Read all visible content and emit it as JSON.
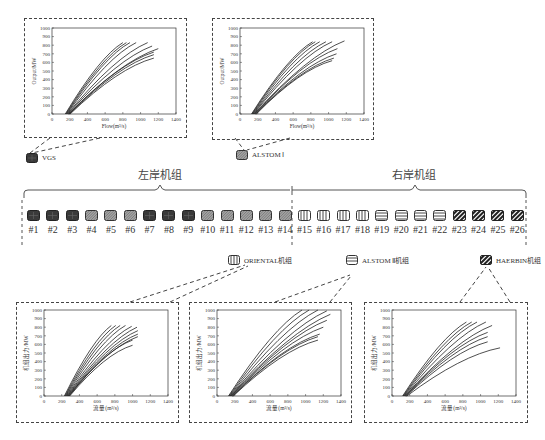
{
  "banks": {
    "left_label": "左岸机组",
    "right_label": "右岸机组"
  },
  "legend": [
    {
      "id": "vgs",
      "label": "VGS",
      "pattern": "dark-crosshatch"
    },
    {
      "id": "alstom1",
      "label": "ALSTOM Ⅰ",
      "pattern": "fine-diagonal"
    },
    {
      "id": "oriental",
      "label": "ORIENTAL机组",
      "pattern": "vertical-stripes"
    },
    {
      "id": "alstom2",
      "label": "ALSTOM Ⅱ机组",
      "pattern": "horizontal-stripes"
    },
    {
      "id": "haerbin",
      "label": "HAERBIN机组",
      "pattern": "bold-diagonal"
    }
  ],
  "units": [
    {
      "label": "#1",
      "type": "vgs"
    },
    {
      "label": "#2",
      "type": "vgs"
    },
    {
      "label": "#3",
      "type": "vgs"
    },
    {
      "label": "#4",
      "type": "alstom1"
    },
    {
      "label": "#5",
      "type": "alstom1"
    },
    {
      "label": "#6",
      "type": "alstom1"
    },
    {
      "label": "#7",
      "type": "vgs"
    },
    {
      "label": "#8",
      "type": "vgs"
    },
    {
      "label": "#9",
      "type": "vgs"
    },
    {
      "label": "#10",
      "type": "alstom1"
    },
    {
      "label": "#11",
      "type": "alstom1"
    },
    {
      "label": "#12",
      "type": "alstom1"
    },
    {
      "label": "#13",
      "type": "alstom1"
    },
    {
      "label": "#14",
      "type": "alstom1"
    },
    {
      "label": "#15",
      "type": "oriental"
    },
    {
      "label": "#16",
      "type": "oriental"
    },
    {
      "label": "#17",
      "type": "oriental"
    },
    {
      "label": "#18",
      "type": "oriental"
    },
    {
      "label": "#19",
      "type": "alstom2"
    },
    {
      "label": "#20",
      "type": "alstom2"
    },
    {
      "label": "#21",
      "type": "alstom2"
    },
    {
      "label": "#22",
      "type": "alstom2"
    },
    {
      "label": "#23",
      "type": "haerbin"
    },
    {
      "label": "#24",
      "type": "haerbin"
    },
    {
      "label": "#25",
      "type": "haerbin"
    },
    {
      "label": "#26",
      "type": "haerbin"
    }
  ],
  "charts": {
    "vgs": {
      "xlabel": "Flow(m³/s)",
      "ylabel": "Output/MW",
      "xticks": [
        "0",
        "200",
        "400",
        "600",
        "800",
        "1000",
        "1200",
        "1400"
      ],
      "yticks": [
        "0",
        "100",
        "200",
        "300",
        "400",
        "500",
        "600",
        "700",
        "800",
        "900",
        "1000"
      ]
    },
    "alstom1": {
      "xlabel": "Flow(m³/s)",
      "ylabel": "Output/MW",
      "xticks": [
        "0",
        "200",
        "400",
        "600",
        "800",
        "1000",
        "1200",
        "1400"
      ],
      "yticks": [
        "0",
        "100",
        "200",
        "300",
        "400",
        "500",
        "600",
        "700",
        "800",
        "900",
        "1000"
      ]
    },
    "oriental": {
      "xlabel": "流量(m³/s)",
      "ylabel": "机组出力/MW",
      "xticks": [
        "0",
        "200",
        "400",
        "600",
        "800",
        "1000",
        "1200",
        "1400"
      ],
      "yticks": [
        "0",
        "100",
        "200",
        "300",
        "400",
        "500",
        "600",
        "700",
        "800",
        "900",
        "1000"
      ]
    },
    "alstom2": {
      "xlabel": "流量(m³/s)",
      "ylabel": "机组出力/MW",
      "xticks": [
        "0",
        "200",
        "400",
        "600",
        "800",
        "1000",
        "1200",
        "1400"
      ],
      "yticks": [
        "0",
        "100",
        "200",
        "300",
        "400",
        "500",
        "600",
        "700",
        "800",
        "900",
        "1000"
      ]
    },
    "haerbin": {
      "xlabel": "流量(m³/s)",
      "ylabel": "机组出力/MW",
      "xticks": [
        "0",
        "200",
        "400",
        "600",
        "800",
        "1000",
        "1200",
        "1400"
      ],
      "yticks": [
        "0",
        "100",
        "200",
        "300",
        "400",
        "500",
        "600",
        "700",
        "800",
        "900",
        "1000"
      ]
    }
  },
  "curves": {
    "vgs": {
      "start": 150,
      "ends": [
        [
          800,
          830
        ],
        [
          840,
          830
        ],
        [
          880,
          830
        ],
        [
          950,
          830
        ],
        [
          1080,
          830
        ],
        [
          1130,
          790
        ],
        [
          1200,
          760
        ],
        [
          1150,
          720
        ],
        [
          1150,
          690
        ],
        [
          1150,
          650
        ]
      ]
    },
    "alstom1": {
      "start": 130,
      "ends": [
        [
          820,
          840
        ],
        [
          850,
          840
        ],
        [
          900,
          840
        ],
        [
          970,
          840
        ],
        [
          1040,
          840
        ],
        [
          1180,
          850
        ],
        [
          1100,
          760
        ],
        [
          1090,
          700
        ],
        [
          1060,
          650
        ],
        [
          1040,
          620
        ]
      ]
    },
    "oriental": {
      "start": 230,
      "ends": [
        [
          760,
          820
        ],
        [
          810,
          820
        ],
        [
          860,
          820
        ],
        [
          920,
          820
        ],
        [
          990,
          810
        ],
        [
          1050,
          800
        ],
        [
          1060,
          760
        ],
        [
          1060,
          720
        ],
        [
          1060,
          690
        ],
        [
          1000,
          650
        ],
        [
          1000,
          590
        ]
      ]
    },
    "alstom2": {
      "start": 130,
      "ends": [
        [
          960,
          1000
        ],
        [
          1040,
          1000
        ],
        [
          1140,
          1000
        ],
        [
          1240,
          990
        ],
        [
          1280,
          950
        ],
        [
          1240,
          880
        ],
        [
          1200,
          800
        ],
        [
          1160,
          720
        ],
        [
          1140,
          690
        ],
        [
          1140,
          650
        ]
      ]
    },
    "haerbin": {
      "start": 120,
      "ends": [
        [
          840,
          860
        ],
        [
          900,
          860
        ],
        [
          960,
          860
        ],
        [
          1060,
          860
        ],
        [
          1130,
          820
        ],
        [
          1080,
          740
        ],
        [
          1080,
          690
        ],
        [
          1080,
          630
        ],
        [
          1220,
          560
        ]
      ]
    }
  }
}
